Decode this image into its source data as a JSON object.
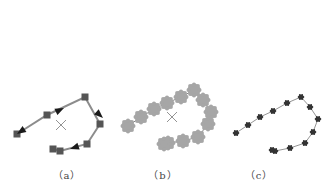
{
  "figure": {
    "panels": [
      {
        "id": "a",
        "label": "（a）",
        "label_x": 67,
        "style": "squares-with-arrows",
        "line_color": "#8c8c8c",
        "marker_color": "#555555",
        "center_cross": [
          61,
          125
        ],
        "points": [
          [
            17,
            134
          ],
          [
            47,
            115
          ],
          [
            85,
            97
          ],
          [
            100,
            124
          ],
          [
            87,
            144
          ],
          [
            60,
            151
          ],
          [
            53,
            149
          ]
        ],
        "arrows": [
          [
            [
              35,
              122
            ],
            [
              64,
              108
            ]
          ],
          [
            [
              92,
              108
            ],
            [
              103,
              118
            ]
          ],
          [
            [
              82,
              145
            ],
            [
              70,
              149
            ]
          ],
          [
            [
              35,
              122
            ],
            [
              17,
              134
            ]
          ]
        ]
      },
      {
        "id": "b",
        "label": "（b）",
        "label_x": 163,
        "style": "gray-blobs",
        "line_color": "#666666",
        "marker_color": "#a6a6a6",
        "center_cross": [
          172,
          117
        ],
        "points": [
          [
            128,
            126
          ],
          [
            141,
            117
          ],
          [
            154,
            109
          ],
          [
            167,
            103
          ],
          [
            181,
            97
          ],
          [
            194,
            90
          ],
          [
            203,
            100
          ],
          [
            211,
            112
          ],
          [
            208,
            124
          ],
          [
            198,
            137
          ],
          [
            183,
            141
          ],
          [
            168,
            143
          ],
          [
            164,
            144
          ]
        ]
      },
      {
        "id": "c",
        "label": "（c）",
        "label_x": 259,
        "style": "small-dark-dots",
        "line_color": "#888888",
        "marker_color": "#333333",
        "points": [
          [
            236,
            133
          ],
          [
            248,
            125
          ],
          [
            260,
            117
          ],
          [
            273,
            111
          ],
          [
            287,
            103
          ],
          [
            301,
            97
          ],
          [
            310,
            107
          ],
          [
            318,
            119
          ],
          [
            313,
            132
          ],
          [
            305,
            143
          ],
          [
            290,
            148
          ],
          [
            275,
            151
          ],
          [
            272,
            150
          ]
        ]
      }
    ]
  }
}
